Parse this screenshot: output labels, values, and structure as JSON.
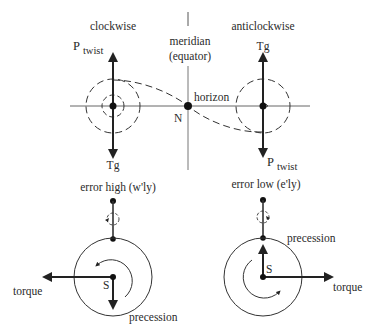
{
  "diagram": {
    "type": "gyrocompass-precession",
    "colors": {
      "ink": "#222222",
      "background": "#ffffff",
      "light_line": "#555555"
    },
    "top": {
      "left_label": "clockwise",
      "right_label": "anticlockwise",
      "meridian_label_line1": "meridian",
      "meridian_label_line2": "(equator)",
      "horizon_label": "horizon",
      "north_label": "N",
      "left_up_label_main": "P",
      "left_up_label_sub": "twist",
      "left_down_label": "Tg",
      "right_up_label": "Tg",
      "right_down_label_main": "P",
      "right_down_label_sub": "twist"
    },
    "bottom": {
      "left": {
        "title": "error high (w'ly)",
        "center_label": "S",
        "torque_label": "torque",
        "precession_label": "precession",
        "torque_direction": "west",
        "precession_vector": "down",
        "rotation": "anticlockwise"
      },
      "right": {
        "title": "error low (e'ly)",
        "center_label": "S",
        "torque_label": "torque",
        "precession_label": "precession",
        "torque_direction": "east",
        "precession_vector": "up",
        "rotation": "clockwise"
      }
    }
  }
}
